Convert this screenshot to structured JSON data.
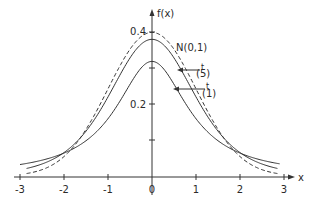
{
  "chart_data": {
    "type": "line",
    "title": "",
    "xlabel": "x",
    "ylabel": "f(x)",
    "xlim": [
      -3.2,
      3.2
    ],
    "ylim": [
      0,
      0.42
    ],
    "x_ticks": [
      -3,
      -2,
      -1,
      0,
      1,
      2,
      3
    ],
    "x_tick_labels": [
      "-3",
      "-2",
      "-1",
      "0",
      "1",
      "2",
      "3"
    ],
    "y_ticks": [
      0.1,
      0.2,
      0.3,
      0.4
    ],
    "y_tick_labels": [
      "",
      "0.2",
      "",
      "0.4"
    ],
    "grid": false,
    "legend": "inline annotations",
    "series": [
      {
        "name": "N(0,1)",
        "style": "dashed",
        "distribution": "standard normal",
        "peak": 0.399
      },
      {
        "name": "t(5)",
        "style": "solid",
        "distribution": "Student t, 5 df",
        "peak": 0.38
      },
      {
        "name": "t(1)",
        "style": "solid",
        "distribution": "Student t, 1 df (Cauchy)",
        "peak": 0.318
      }
    ],
    "annotations": [
      {
        "text": "N(0,1)",
        "x": 0.6,
        "y": 0.37
      },
      {
        "text": "t(5)",
        "x": 0.95,
        "y": 0.3,
        "arrow_to_x": 0.6
      },
      {
        "text": "t(1)",
        "x": 1.2,
        "y": 0.25,
        "arrow_to_x": 0.45
      }
    ]
  },
  "labels": {
    "x_axis": "x",
    "y_axis": "f(x)",
    "normal": "N(0,1)",
    "t5_base": "t",
    "t5_sub": "(5)",
    "t1_base": "t",
    "t1_sub": "(1)",
    "y04": "0.4",
    "y02": "0.2",
    "xm3": "-3",
    "xm2": "-2",
    "xm1": "-1",
    "x0": "0",
    "x1": "1",
    "x2": "2",
    "x3": "3"
  }
}
